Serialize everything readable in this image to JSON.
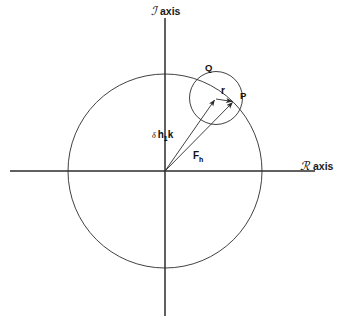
{
  "figure": {
    "background_color": "#ffffff",
    "stroke_color": "#2b2b2b",
    "width": 356,
    "height": 331
  },
  "axes": {
    "imaginary": {
      "glyph": "ℐ",
      "label": "axis",
      "orientation": "vertical",
      "x": 165,
      "y_top": 18,
      "y_bottom": 316,
      "label_x": 151,
      "label_y": 15
    },
    "real": {
      "glyph": "ℛ",
      "label": "axis",
      "orientation": "horizontal",
      "y": 171,
      "x_left": 10,
      "x_right": 315,
      "label_x": 300,
      "label_y": 170
    }
  },
  "origin": {
    "x": 165,
    "y": 171
  },
  "circles": [
    {
      "name": "outer-circle",
      "cx": 165,
      "cy": 171,
      "r": 97
    },
    {
      "name": "inner-circle",
      "cx": 216,
      "cy": 98,
      "r": 26.5
    }
  ],
  "points": [
    {
      "name": "P",
      "label": "P",
      "x": 234,
      "y": 101,
      "label_x": 240,
      "label_y": 99
    },
    {
      "name": "Q",
      "label": "Q",
      "x": 208,
      "y": 78,
      "label_x": 205,
      "label_y": 71
    }
  ],
  "vectors": [
    {
      "name": "delta-h1-k",
      "label_prefix": "δ",
      "label_main": "h",
      "label_sub": "1",
      "label_tail": "k",
      "from_x": 165,
      "from_y": 171,
      "to_x": 216,
      "to_y": 98,
      "label_x": 152,
      "label_y": 138
    },
    {
      "name": "F-h",
      "label_prefix": "",
      "label_main": "F",
      "label_sub": "h",
      "label_tail": "",
      "from_x": 165,
      "from_y": 171,
      "to_x": 234,
      "to_y": 101,
      "label_x": 193,
      "label_y": 159
    },
    {
      "name": "r",
      "label_prefix": "",
      "label_main": "r",
      "label_sub": "",
      "label_tail": "",
      "from_x": 216,
      "from_y": 98,
      "to_x": 234,
      "to_y": 101,
      "label_x": 221,
      "label_y": 94
    }
  ]
}
